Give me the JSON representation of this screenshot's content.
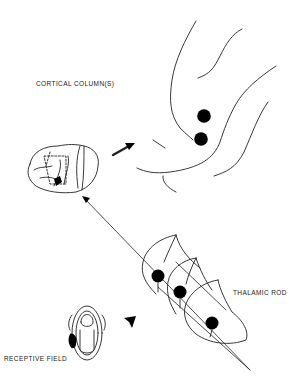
{
  "labels": {
    "cortical_columns": "CORTICAL COLUMN(S)",
    "thalamic_rod": "THALAMIC ROD",
    "receptive_field": "RECEPTIVE FIELD"
  },
  "components": [
    {
      "id": "cortex-detail",
      "description": "Enlarged cortical folds with two cortical columns (black dots)",
      "dots": 2
    },
    {
      "id": "brain",
      "description": "Side view of brain with marked cortical region"
    },
    {
      "id": "thalamus",
      "description": "Three crescent-shaped thalamic slices with a rod of three neurons",
      "dots": 3
    },
    {
      "id": "receptive-field",
      "description": "Body/hand outline with shaded receptive field"
    }
  ],
  "arrows": [
    {
      "from": "brain",
      "to": "cortex-detail",
      "style": "bold short arrow"
    },
    {
      "from": "thalamus",
      "to": "brain",
      "style": "long thin line with arrowhead"
    },
    {
      "from": "receptive-field",
      "to": "thalamus",
      "style": "bold short arrow"
    }
  ],
  "colors": {
    "ink": "#222222",
    "background": "#ffffff"
  }
}
